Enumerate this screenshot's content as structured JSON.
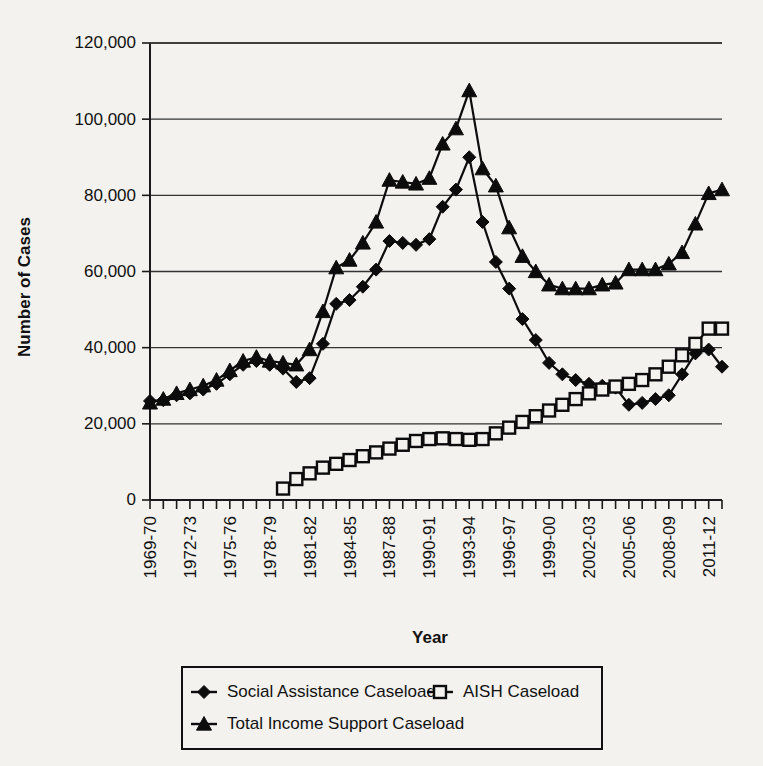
{
  "chart_data": {
    "type": "line",
    "title": "",
    "xlabel": "Year",
    "ylabel": "Number of Cases",
    "ylim": [
      0,
      120000
    ],
    "ytick_labels": [
      "0",
      "20,000",
      "40,000",
      "60,000",
      "80,000",
      "100,000",
      "120,000"
    ],
    "ytick_values": [
      0,
      20000,
      40000,
      60000,
      80000,
      100000,
      120000
    ],
    "grid": true,
    "legend_position": "bottom",
    "x": [
      "1969-70",
      "1970-71",
      "1971-72",
      "1972-73",
      "1973-74",
      "1974-75",
      "1975-76",
      "1976-77",
      "1977-78",
      "1978-79",
      "1979-80",
      "1980-81",
      "1981-82",
      "1982-83",
      "1983-84",
      "1984-85",
      "1985-86",
      "1986-87",
      "1987-88",
      "1988-89",
      "1989-90",
      "1990-91",
      "1991-92",
      "1992-93",
      "1993-94",
      "1994-95",
      "1995-96",
      "1996-97",
      "1997-98",
      "1998-99",
      "1999-00",
      "2000-01",
      "2001-02",
      "2002-03",
      "2003-04",
      "2004-05",
      "2005-06",
      "2006-07",
      "2007-08",
      "2008-09",
      "2009-10",
      "2010-11",
      "2011-12",
      "2012-13"
    ],
    "xtick_labels": [
      "1969-70",
      "1972-73",
      "1975-76",
      "1978-79",
      "1981-82",
      "1984-85",
      "1987-88",
      "1990-91",
      "1993-94",
      "1996-97",
      "1999-00",
      "2002-03",
      "2005-06",
      "2008-09",
      "2011-12"
    ],
    "xtick_indices": [
      0,
      3,
      6,
      9,
      12,
      15,
      18,
      21,
      24,
      27,
      30,
      33,
      36,
      39,
      42
    ],
    "series": [
      {
        "name": "Social Assistance Caseload",
        "marker": "diamond",
        "marker_style": "filled",
        "values": [
          26000,
          26200,
          27500,
          28000,
          29000,
          30500,
          33000,
          35500,
          36500,
          35500,
          34500,
          31000,
          32000,
          41000,
          51500,
          52500,
          56000,
          60500,
          68000,
          67500,
          67000,
          68500,
          77000,
          81500,
          90000,
          73000,
          62500,
          55500,
          47500,
          42000,
          36000,
          33000,
          31500,
          30500,
          30000,
          29500,
          25000,
          25500,
          26500,
          27500,
          33000,
          38500,
          39500,
          35000
        ]
      },
      {
        "name": "AISH Caseload",
        "marker": "square",
        "marker_style": "open",
        "values": [
          null,
          null,
          null,
          null,
          null,
          null,
          null,
          null,
          null,
          null,
          3000,
          5500,
          7000,
          8500,
          9500,
          10500,
          11500,
          12500,
          13500,
          14500,
          15500,
          16000,
          16200,
          16000,
          15800,
          16000,
          17500,
          19000,
          20500,
          22000,
          23500,
          25000,
          26500,
          28000,
          29000,
          29800,
          30500,
          31500,
          33000,
          35000,
          38000,
          41000,
          45000,
          45000
        ]
      },
      {
        "name": "Total Income Support Caseload",
        "marker": "triangle",
        "marker_style": "filled",
        "values": [
          25500,
          26500,
          28000,
          29000,
          30000,
          31500,
          34000,
          36500,
          37500,
          36500,
          36000,
          35500,
          39500,
          49500,
          61000,
          63000,
          67500,
          73000,
          84000,
          83500,
          83000,
          84500,
          93500,
          97500,
          107500,
          87000,
          82500,
          71500,
          64000,
          60000,
          56500,
          55500,
          55500,
          55500,
          56500,
          57000,
          60500,
          60500,
          60500,
          62000,
          65000,
          72500,
          80500,
          81500
        ]
      }
    ],
    "legend": [
      {
        "label": "Social Assistance Caseload",
        "marker": "diamond",
        "marker_style": "filled"
      },
      {
        "label": "AISH Caseload",
        "marker": "square",
        "marker_style": "open"
      },
      {
        "label": "Total Income Support Caseload",
        "marker": "triangle",
        "marker_style": "filled"
      }
    ],
    "colors": {
      "line": "#0c0c0c",
      "grid": "#333333",
      "axis": "#1a1a1a",
      "background": "#f3f2ee"
    }
  }
}
